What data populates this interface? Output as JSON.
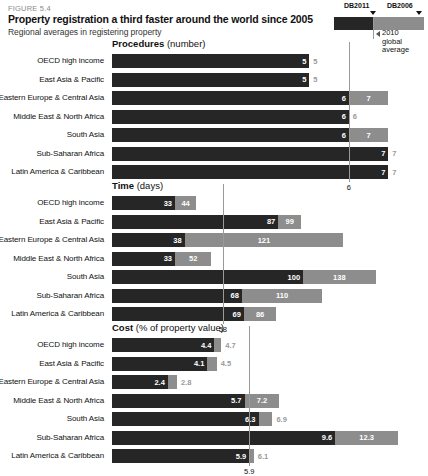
{
  "figure": {
    "number": "FIGURE 5.4",
    "title": "Property registration a third faster around the world since 2005",
    "subtitle": "Regional averages in registering property"
  },
  "legend": {
    "dark_label": "DB2011",
    "light_label": "DB2006",
    "note_line1": "2010",
    "note_line2": "global",
    "note_line3": "average",
    "dark_color": "#262626",
    "light_color": "#8d8d8d"
  },
  "regions": [
    "OECD high income",
    "East Asia & Pacific",
    "Eastern Europe & Central Asia",
    "Middle East & North Africa",
    "South Asia",
    "Sub-Saharan Africa",
    "Latin America & Caribbean"
  ],
  "chart_data": [
    {
      "type": "bar",
      "title": "Procedures",
      "unit": "(number)",
      "xlabel": "",
      "ylabel": "",
      "orientation": "horizontal",
      "grid": false,
      "legend_position": "top-right",
      "categories": [
        "OECD high income",
        "East Asia & Pacific",
        "Eastern Europe & Central Asia",
        "Middle East & North Africa",
        "South Asia",
        "Sub-Saharan Africa",
        "Latin America & Caribbean"
      ],
      "series": [
        {
          "name": "DB2011",
          "values": [
            5,
            5,
            6,
            6,
            6,
            7,
            7
          ]
        },
        {
          "name": "DB2006",
          "values": [
            5,
            5,
            7,
            6,
            7,
            7,
            7
          ]
        }
      ],
      "reference_line": {
        "label": "6",
        "value": 6
      },
      "xlim": [
        0,
        7.6
      ]
    },
    {
      "type": "bar",
      "title": "Time",
      "unit": "(days)",
      "xlabel": "",
      "ylabel": "",
      "orientation": "horizontal",
      "grid": false,
      "categories": [
        "OECD high income",
        "East Asia & Pacific",
        "Eastern Europe & Central Asia",
        "Middle East & North Africa",
        "South Asia",
        "Sub-Saharan Africa",
        "Latin America & Caribbean"
      ],
      "series": [
        {
          "name": "DB2011",
          "values": [
            33,
            87,
            38,
            33,
            100,
            68,
            69
          ]
        },
        {
          "name": "DB2006",
          "values": [
            44,
            99,
            121,
            52,
            138,
            110,
            86
          ]
        }
      ],
      "reference_line": {
        "label": "58",
        "value": 58
      },
      "xlim": [
        0,
        157
      ]
    },
    {
      "type": "bar",
      "title": "Cost",
      "unit": "(% of property value)",
      "xlabel": "",
      "ylabel": "",
      "orientation": "horizontal",
      "grid": false,
      "categories": [
        "OECD high income",
        "East Asia & Pacific",
        "Eastern Europe & Central Asia",
        "Middle East & North Africa",
        "South Asia",
        "Sub-Saharan Africa",
        "Latin America & Caribbean"
      ],
      "series": [
        {
          "name": "DB2011",
          "values": [
            4.4,
            4.1,
            2.4,
            5.7,
            6.3,
            9.6,
            5.9
          ]
        },
        {
          "name": "DB2006",
          "values": [
            4.7,
            4.5,
            2.8,
            7.2,
            6.9,
            12.3,
            6.1
          ]
        }
      ],
      "reference_line": {
        "label": "5.9",
        "value": 5.9
      },
      "xlim": [
        0,
        12.9
      ]
    }
  ]
}
